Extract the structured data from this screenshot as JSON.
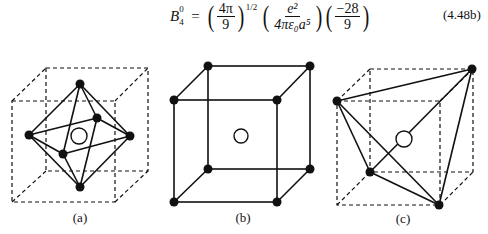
{
  "equation": {
    "lhs_symbol": "B",
    "lhs_superscript": "0",
    "lhs_subscript": "4",
    "equals": "=",
    "factor1": {
      "numerator": "4π",
      "denominator": "9",
      "exponent": "1/2"
    },
    "factor2": {
      "numerator": "e²",
      "denominator": "4πε₀a⁵"
    },
    "factor3": {
      "numerator": "−28",
      "denominator": "9"
    },
    "number": "(4.48b)"
  },
  "figures": [
    {
      "id": "a",
      "label": "(a)",
      "description": "octahedral coordination inside dashed cube",
      "ligands": 6,
      "cube_style": "dashed"
    },
    {
      "id": "b",
      "label": "(b)",
      "description": "cubic coordination, ligands at cube corners",
      "ligands": 8,
      "cube_style": "solid"
    },
    {
      "id": "c",
      "label": "(c)",
      "description": "tetrahedral coordination inside dashed cube",
      "ligands": 4,
      "cube_style": "dashed"
    }
  ],
  "colors": {
    "ink": "#111111",
    "background": "#ffffff"
  }
}
